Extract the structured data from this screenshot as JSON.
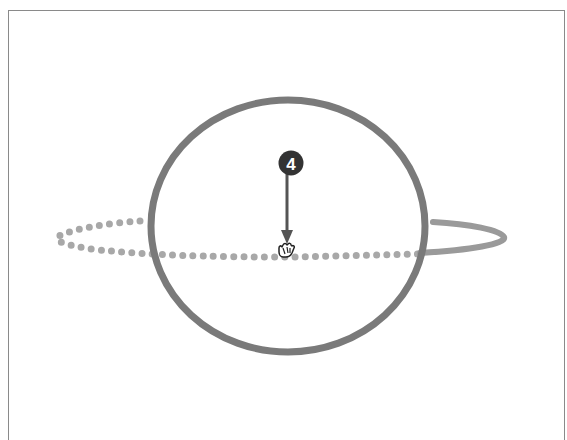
{
  "figure": {
    "step_badge": {
      "label": "4",
      "color": "#333333",
      "text_color": "#ffffff"
    },
    "colors": {
      "frame": "#8a8a8a",
      "sphere_outline": "#7a7a7a",
      "orbit_dotted": "#a8a8a8",
      "orbit_solid": "#9a9a9a",
      "arrow": "#555555",
      "cursor": "#222222"
    },
    "elements": {
      "sphere": {
        "cx": 288,
        "cy": 226,
        "rx": 138,
        "ry": 126
      },
      "orbit_path_front_dotted": "back half of orbit, drawn as dots",
      "orbit_path_right_solid": "right tail of orbit, drawn solid",
      "cursor": {
        "type": "hand-grab-cursor",
        "x": 284,
        "y": 250
      },
      "arrow": {
        "from_y": 176,
        "to_y": 243,
        "x": 287
      }
    }
  }
}
